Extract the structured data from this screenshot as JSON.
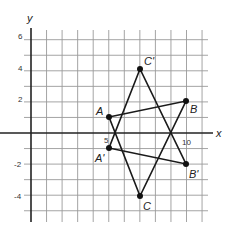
{
  "diagram": {
    "type": "coordinate-grid",
    "axes": {
      "x_label": "x",
      "y_label": "y"
    },
    "y_tick_labels": [
      "6",
      "4",
      "2",
      "-2",
      "-4"
    ],
    "x_tick_labels": [
      "5",
      "10"
    ],
    "grid": {
      "x_min": 0,
      "x_max": 11,
      "y_min": -5,
      "y_max": 6
    },
    "points": [
      {
        "label": "A",
        "x": 5,
        "y": 1
      },
      {
        "label": "B",
        "x": 10,
        "y": 2
      },
      {
        "label": "C'",
        "x": 7,
        "y": 4
      },
      {
        "label": "A'",
        "x": 5,
        "y": -1
      },
      {
        "label": "B'",
        "x": 10,
        "y": -2
      },
      {
        "label": "C",
        "x": 7,
        "y": -4
      }
    ],
    "triangles": [
      {
        "name": "ABC",
        "vertices": [
          "A",
          "B",
          "C"
        ]
      },
      {
        "name": "A'B'C'",
        "vertices": [
          "A'",
          "B'",
          "C'"
        ]
      }
    ]
  }
}
